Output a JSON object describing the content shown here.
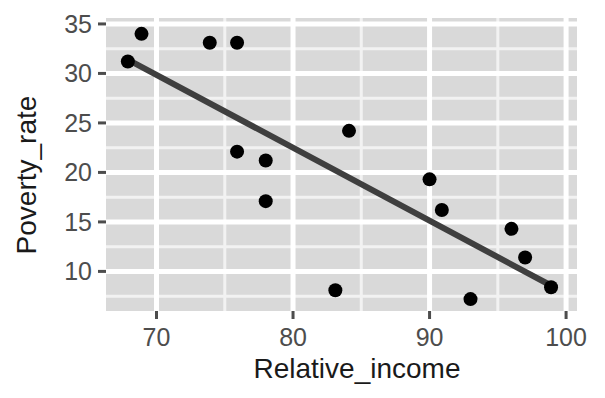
{
  "chart_data": {
    "type": "scatter",
    "title": "",
    "xlabel": "Relative_income",
    "ylabel": "Poverty_rate",
    "xlim": [
      66.3,
      100.8
    ],
    "ylim": [
      6.0,
      35.6
    ],
    "xticks": [
      70,
      80,
      90,
      100
    ],
    "yticks": [
      35,
      30,
      25,
      20,
      15,
      10
    ],
    "xtick_labels": [
      "70",
      "80",
      "90",
      "100"
    ],
    "ytick_labels": [
      "35",
      "30",
      "25",
      "20",
      "15",
      "10"
    ],
    "grid": true,
    "grid_major_color": "#ffffff",
    "grid_minor_color": "#f2f2f2",
    "panel_background": "#d9d9d9",
    "point_color": "#000000",
    "point_size": 7,
    "legend": "none",
    "points": [
      {
        "x": 67.9,
        "y": 31.2
      },
      {
        "x": 68.9,
        "y": 34.0
      },
      {
        "x": 73.9,
        "y": 33.1
      },
      {
        "x": 75.9,
        "y": 33.1
      },
      {
        "x": 75.9,
        "y": 22.1
      },
      {
        "x": 78.0,
        "y": 21.2
      },
      {
        "x": 78.0,
        "y": 17.1
      },
      {
        "x": 83.1,
        "y": 8.1
      },
      {
        "x": 84.1,
        "y": 24.2
      },
      {
        "x": 90.0,
        "y": 19.3
      },
      {
        "x": 90.9,
        "y": 16.2
      },
      {
        "x": 93.0,
        "y": 7.2
      },
      {
        "x": 96.0,
        "y": 14.3
      },
      {
        "x": 97.0,
        "y": 11.4
      },
      {
        "x": 98.9,
        "y": 8.4
      }
    ],
    "trend_line": {
      "type": "linear-fit",
      "color": "#3f3f3f",
      "width": 6,
      "x0": 67.9,
      "y0": 31.4,
      "x1": 99.0,
      "y1": 8.5
    }
  }
}
